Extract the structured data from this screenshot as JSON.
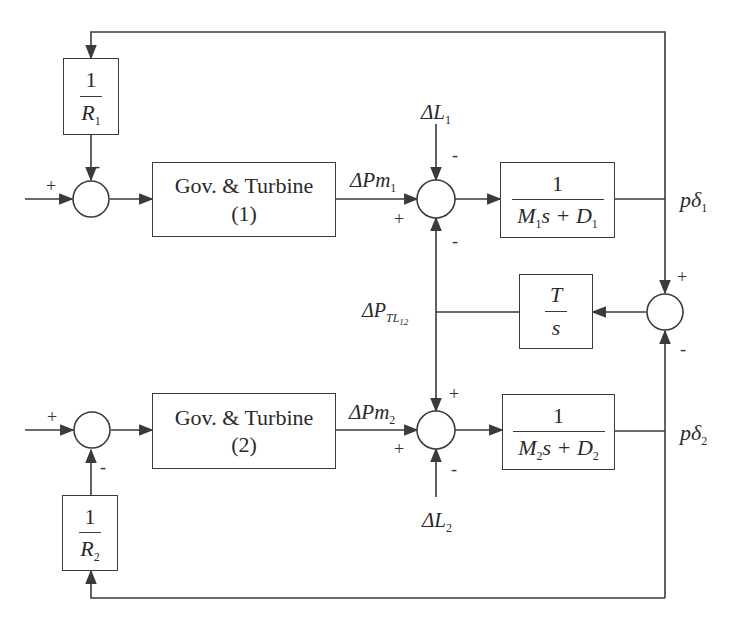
{
  "diagram": {
    "type": "block-diagram",
    "blocks": {
      "r1": {
        "num": "1",
        "den": "R",
        "den_sub": "1"
      },
      "r2": {
        "num": "1",
        "den": "R",
        "den_sub": "2"
      },
      "gov1": {
        "line1": "Gov. & Turbine",
        "line2": "(1)"
      },
      "gov2": {
        "line1": "Gov. & Turbine",
        "line2": "(2)"
      },
      "m1": {
        "num": "1",
        "den_a": "M",
        "den_a_sub": "1",
        "den_b": "s + D",
        "den_b_sub": "1"
      },
      "m2": {
        "num": "1",
        "den_a": "M",
        "den_a_sub": "2",
        "den_b": "s + D",
        "den_b_sub": "2"
      },
      "tie": {
        "num": "T",
        "den": "s"
      }
    },
    "signals": {
      "dpm1": {
        "prefix": "ΔPm",
        "sub": "1"
      },
      "dpm2": {
        "prefix": "ΔPm",
        "sub": "2"
      },
      "dl1": {
        "prefix": "ΔL",
        "sub": "1"
      },
      "dl2": {
        "prefix": "ΔL",
        "sub": "2"
      },
      "dptl": {
        "prefix": "ΔP",
        "sub": "TL",
        "subsub": "12"
      },
      "pd1": {
        "prefix": "pδ",
        "sub": "1"
      },
      "pd2": {
        "prefix": "pδ",
        "sub": "2"
      }
    },
    "signs": {
      "sum1_in": "+",
      "sum1_fb": "-",
      "sum2_top": "-",
      "sum2_left": "+",
      "sum2_bottom": "-",
      "sum3_top": "+",
      "sum3_bottom": "-",
      "sum4_top": "+",
      "sum4_left": "+",
      "sum4_bottom": "-",
      "sum5_in": "+",
      "sum5_fb": "-"
    },
    "colors": {
      "line": "#3a3a3a",
      "text": "#2a2a2a",
      "background": "#ffffff"
    }
  }
}
